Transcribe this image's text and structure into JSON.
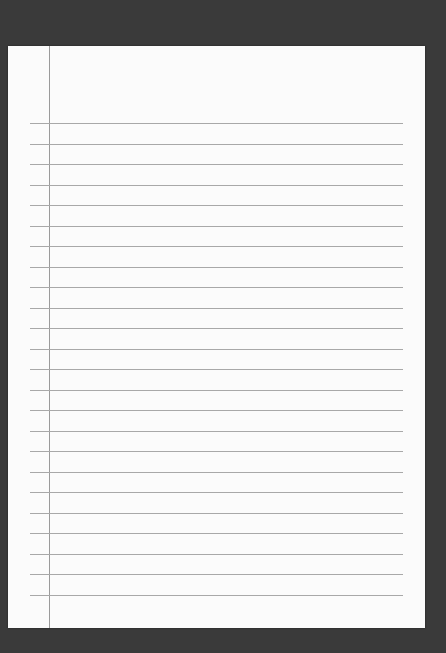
{
  "paper": {
    "type": "lined-notebook-paper",
    "line_count": 24,
    "first_line_y": 77,
    "line_spacing": 20.5,
    "colors": {
      "background": "#3a3a3a",
      "paper": "#fbfbfb",
      "rule": "#a8a8a8",
      "margin": "#9a9a9a"
    }
  }
}
